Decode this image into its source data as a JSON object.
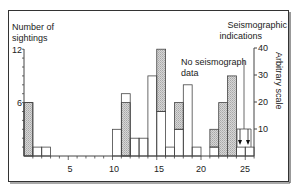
{
  "chart_data": {
    "type": "bar",
    "title": "",
    "xlabel": "",
    "ylabel": "Number of sightings",
    "ylabel_right": "Arbitrary scale",
    "ylim": [
      0,
      12
    ],
    "ylim_right": [
      0,
      40
    ],
    "x_ticks": [
      5,
      10,
      15,
      20,
      25
    ],
    "y_ticks": [
      6,
      12
    ],
    "y_ticks_right": [
      10,
      20,
      30,
      40
    ],
    "grid": false,
    "bin_width": 1,
    "series": [
      {
        "name": "Sightings (open bars)",
        "style": "open",
        "bins": [
          {
            "start": 0,
            "end": 1,
            "value": 6
          },
          {
            "start": 1,
            "end": 2,
            "value": 1
          },
          {
            "start": 2,
            "end": 3,
            "value": 1
          },
          {
            "start": 10,
            "end": 11,
            "value": 3
          },
          {
            "start": 11,
            "end": 12,
            "value": 7
          },
          {
            "start": 12,
            "end": 13,
            "value": 2
          },
          {
            "start": 13,
            "end": 14,
            "value": 2
          },
          {
            "start": 14,
            "end": 15,
            "value": 9
          },
          {
            "start": 15,
            "end": 16,
            "value": 5
          },
          {
            "start": 16,
            "end": 17,
            "value": 1
          },
          {
            "start": 17,
            "end": 18,
            "value": 3
          },
          {
            "start": 18,
            "end": 19,
            "value": 8
          },
          {
            "start": 19,
            "end": 20,
            "value": 1
          },
          {
            "start": 21,
            "end": 22,
            "value": 1
          },
          {
            "start": 24,
            "end": 25,
            "value": 1
          },
          {
            "start": 25,
            "end": 26,
            "value": 1
          }
        ]
      },
      {
        "name": "Seismographic indications (hatched)",
        "style": "hatched",
        "bins": [
          {
            "start": 0,
            "end": 1,
            "from": 0,
            "to": 6
          },
          {
            "start": 11,
            "end": 12,
            "from": 0,
            "to": 6
          },
          {
            "start": 15,
            "end": 16,
            "from": 5,
            "to": 12
          },
          {
            "start": 17,
            "end": 18,
            "from": 3,
            "to": 6
          },
          {
            "start": 21,
            "end": 22,
            "from": 1,
            "to": 3
          },
          {
            "start": 22,
            "end": 23,
            "from": 0,
            "to": 6
          },
          {
            "start": 23,
            "end": 24,
            "from": 0,
            "to": 9
          }
        ]
      }
    ],
    "annotations": [
      {
        "text": "Seismographic indications",
        "position": "top-right"
      },
      {
        "text": "No seismograph data",
        "position": "over bins 24-26",
        "bracket_to_right_scale": 10
      }
    ]
  },
  "labels": {
    "y_left_line1": "Number of",
    "y_left_line2": "sightings",
    "y_right_title_line1": "Seismographic",
    "y_right_title_line2": "indications",
    "y_right_axis": "Arbitrary scale",
    "no_data_line1": "No seismograph",
    "no_data_line2": "data",
    "tick_y12": "12",
    "tick_y6": "6",
    "tick_r40": "40",
    "tick_r30": "30",
    "tick_r20": "20",
    "tick_r10": "10",
    "tick_x5": "5",
    "tick_x10": "10",
    "tick_x15": "15",
    "tick_x20": "20",
    "tick_x25": "25"
  },
  "colors": {
    "frame": "#333333",
    "bar_stroke": "#444444",
    "hatch_fill": "#c8c8c8"
  }
}
